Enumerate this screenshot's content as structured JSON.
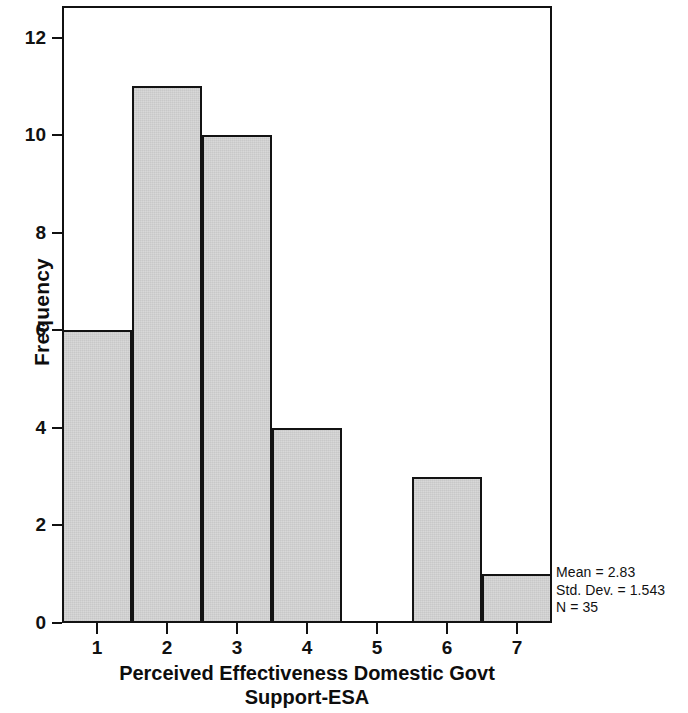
{
  "chart_data": {
    "type": "bar",
    "title": "",
    "subtitle": "",
    "xlabel": "Perceived Effectiveness Domestic Govt Support-ESA",
    "xlabel_line1": "Perceived Effectiveness Domestic Govt",
    "xlabel_line2": "Support-ESA",
    "ylabel": "Frequency",
    "categories": [
      "1",
      "2",
      "3",
      "4",
      "5",
      "6",
      "7"
    ],
    "values": [
      6,
      11,
      10,
      4,
      0,
      3,
      1
    ],
    "xlim": [
      0.5,
      7.5
    ],
    "ylim": [
      0,
      12.65
    ],
    "xticks": [
      "1",
      "2",
      "3",
      "4",
      "5",
      "6",
      "7"
    ],
    "yticks": [
      "0",
      "2",
      "4",
      "6",
      "8",
      "10",
      "12"
    ],
    "ytick_values": [
      0,
      2,
      4,
      6,
      8,
      10,
      12
    ],
    "grid": false,
    "legend": false,
    "legend_position": "none",
    "bar_fill_color": "#d6d6d6",
    "bar_edge_color": "#131313",
    "annotations": [
      "Mean = 2.83",
      "Std. Dev. = 1.543",
      "N = 35"
    ]
  },
  "stats": {
    "mean": "Mean = 2.83",
    "std_dev": "Std. Dev. = 1.543",
    "n": "N = 35"
  }
}
